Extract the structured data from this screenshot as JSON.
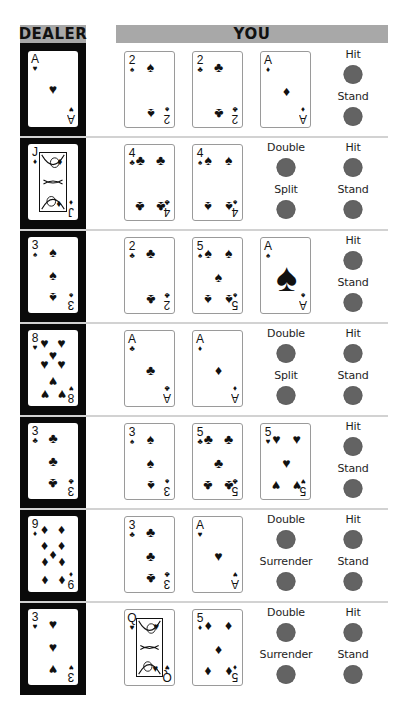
{
  "headers": {
    "dealer": "DEALER",
    "you": "YOU"
  },
  "colors": {
    "header_bg": "#a8a8a8",
    "dealer_column": "#0a0a0a",
    "button": "#636363",
    "divider": "#d2d2d2"
  },
  "rows": [
    {
      "dealer": {
        "rank": "A",
        "suit": "♥"
      },
      "player": [
        {
          "rank": "2",
          "suit": "♠"
        },
        {
          "rank": "2",
          "suit": "♣"
        },
        {
          "rank": "A",
          "suit": "♦"
        }
      ],
      "actions": [
        {
          "id": "hit",
          "label": "Hit"
        },
        {
          "id": "stand",
          "label": "Stand"
        }
      ]
    },
    {
      "dealer": {
        "rank": "J",
        "suit": "♦"
      },
      "player": [
        {
          "rank": "4",
          "suit": "♣"
        },
        {
          "rank": "4",
          "suit": "♠"
        }
      ],
      "actions": [
        {
          "id": "double",
          "label": "Double"
        },
        {
          "id": "hit",
          "label": "Hit"
        },
        {
          "id": "split",
          "label": "Split"
        },
        {
          "id": "stand",
          "label": "Stand"
        }
      ]
    },
    {
      "dealer": {
        "rank": "3",
        "suit": "♠"
      },
      "player": [
        {
          "rank": "2",
          "suit": "♣"
        },
        {
          "rank": "5",
          "suit": "♠"
        },
        {
          "rank": "A",
          "suit": "♠"
        }
      ],
      "actions": [
        {
          "id": "hit",
          "label": "Hit"
        },
        {
          "id": "stand",
          "label": "Stand"
        }
      ]
    },
    {
      "dealer": {
        "rank": "8",
        "suit": "♥"
      },
      "player": [
        {
          "rank": "A",
          "suit": "♣"
        },
        {
          "rank": "A",
          "suit": "♦"
        }
      ],
      "actions": [
        {
          "id": "double",
          "label": "Double"
        },
        {
          "id": "hit",
          "label": "Hit"
        },
        {
          "id": "split",
          "label": "Split"
        },
        {
          "id": "stand",
          "label": "Stand"
        }
      ]
    },
    {
      "dealer": {
        "rank": "3",
        "suit": "♣"
      },
      "player": [
        {
          "rank": "3",
          "suit": "♠"
        },
        {
          "rank": "5",
          "suit": "♣"
        },
        {
          "rank": "5",
          "suit": "♥"
        }
      ],
      "actions": [
        {
          "id": "hit",
          "label": "Hit"
        },
        {
          "id": "stand",
          "label": "Stand"
        }
      ]
    },
    {
      "dealer": {
        "rank": "9",
        "suit": "♦"
      },
      "player": [
        {
          "rank": "3",
          "suit": "♣"
        },
        {
          "rank": "A",
          "suit": "♥"
        }
      ],
      "actions": [
        {
          "id": "double",
          "label": "Double"
        },
        {
          "id": "hit",
          "label": "Hit"
        },
        {
          "id": "surrender",
          "label": "Surrender"
        },
        {
          "id": "stand",
          "label": "Stand"
        }
      ]
    },
    {
      "dealer": {
        "rank": "3",
        "suit": "♥"
      },
      "player": [
        {
          "rank": "Q",
          "suit": "♥"
        },
        {
          "rank": "5",
          "suit": "♦"
        }
      ],
      "actions": [
        {
          "id": "double",
          "label": "Double"
        },
        {
          "id": "hit",
          "label": "Hit"
        },
        {
          "id": "surrender",
          "label": "Surrender"
        },
        {
          "id": "stand",
          "label": "Stand"
        }
      ]
    }
  ]
}
